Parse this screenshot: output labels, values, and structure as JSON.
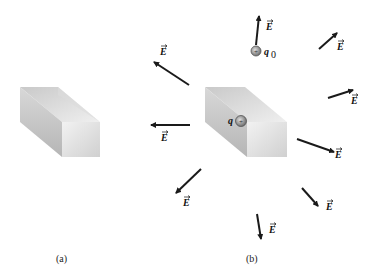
{
  "figure": {
    "panel_a": {
      "caption": "(a)"
    },
    "panel_b": {
      "caption": "(b)",
      "source_charge_label": "q",
      "test_charge_label": "q",
      "test_charge_subscript": "0",
      "field_label": "E"
    }
  },
  "colors": {
    "arrow": "#1a1a1a",
    "box_light": "#e6e6e6",
    "box_dark": "#b8b8b8",
    "charge": "#8a8a8a"
  }
}
